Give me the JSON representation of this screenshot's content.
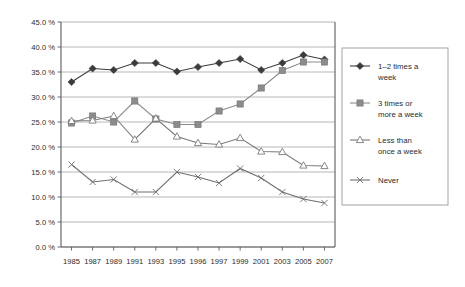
{
  "chart_data": {
    "type": "line",
    "title": "",
    "subtitle": "",
    "xlabel": "",
    "ylabel": "",
    "grid": true,
    "legend_position": "right",
    "ylim": [
      0,
      45
    ],
    "ytick_step": 5,
    "categories": [
      "1985",
      "1987",
      "1989",
      "1991",
      "1993",
      "1995",
      "1996",
      "1997",
      "1999",
      "2001",
      "2003",
      "2005",
      "2007"
    ],
    "ytick_labels": [
      "0.0 %",
      "5.0 %",
      "10.0 %",
      "15.0 %",
      "20.0 %",
      "25.0 %",
      "30.0 %",
      "35.0 %",
      "40.0 %",
      "45.0 %"
    ],
    "ytick_values": [
      0,
      5,
      10,
      15,
      20,
      25,
      30,
      35,
      40,
      45
    ],
    "series": [
      {
        "name": "1–2 times a week",
        "marker": "filled-diamond",
        "color": "#3b3b3b",
        "values": [
          33.0,
          35.7,
          35.4,
          36.8,
          36.8,
          35.1,
          36.0,
          36.8,
          37.6,
          35.4,
          36.8,
          38.4,
          37.5
        ]
      },
      {
        "name": "3 times or more a week",
        "marker": "filled-square",
        "color": "#8c8c8c",
        "values": [
          24.8,
          26.2,
          25.0,
          29.2,
          25.6,
          24.5,
          24.5,
          27.2,
          28.6,
          31.8,
          35.3,
          37.0,
          37.0
        ]
      },
      {
        "name": "Less than once a week",
        "marker": "open-triangle",
        "color": "#7a7a7a",
        "values": [
          25.2,
          25.3,
          26.2,
          21.5,
          25.7,
          22.1,
          20.8,
          20.5,
          21.8,
          19.1,
          19.0,
          16.3,
          16.2
        ]
      },
      {
        "name": "Never",
        "marker": "x-cross",
        "color": "#6e6e6e",
        "values": [
          16.5,
          13.0,
          13.5,
          11.0,
          11.0,
          15.0,
          14.0,
          12.8,
          15.7,
          13.8,
          11.0,
          9.6,
          8.8
        ]
      }
    ]
  },
  "legend": {
    "items": [
      {
        "label_line1": "1–2 times a",
        "label_line2": "week"
      },
      {
        "label_line1": "3 times or",
        "label_line2": "more a week"
      },
      {
        "label_line1": "Less than",
        "label_line2": "once a week"
      },
      {
        "label_line1": "Never",
        "label_line2": ""
      }
    ]
  },
  "colors": {
    "series1": "#3b3b3b",
    "series2": "#8c8c8c",
    "series3": "#7a7a7a",
    "series4": "#6e6e6e",
    "grid": "#aeaeae",
    "axis": "#5a5a5a",
    "background": "#ffffff"
  }
}
